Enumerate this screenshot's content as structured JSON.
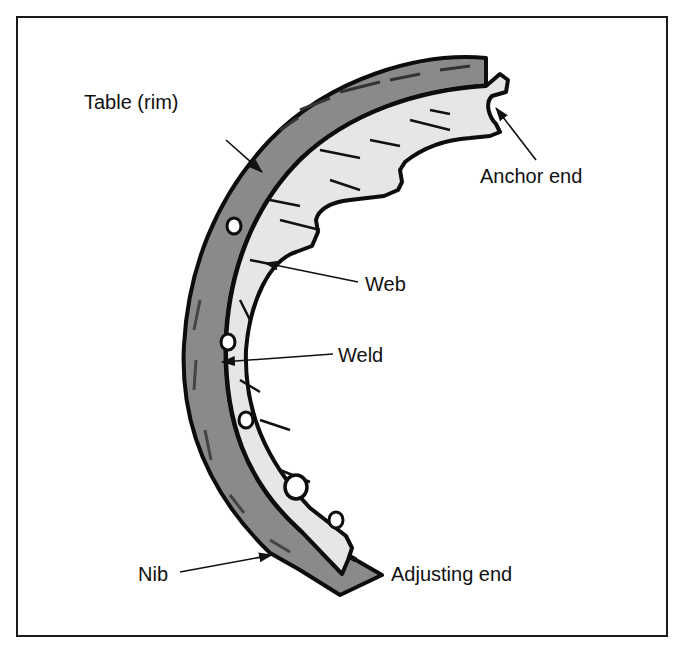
{
  "figure": {
    "labels": {
      "table_rim": "Table (rim)",
      "anchor_end": "Anchor end",
      "web": "Web",
      "weld": "Weld",
      "nib": "Nib",
      "adjusting_end": "Adjusting end"
    }
  },
  "colors": {
    "frame": "#1a1a1a",
    "lining": "#8a8a8a",
    "web_fill": "#e6e6e6",
    "outline": "#0d0d0d",
    "text": "#111111",
    "background": "#ffffff"
  }
}
